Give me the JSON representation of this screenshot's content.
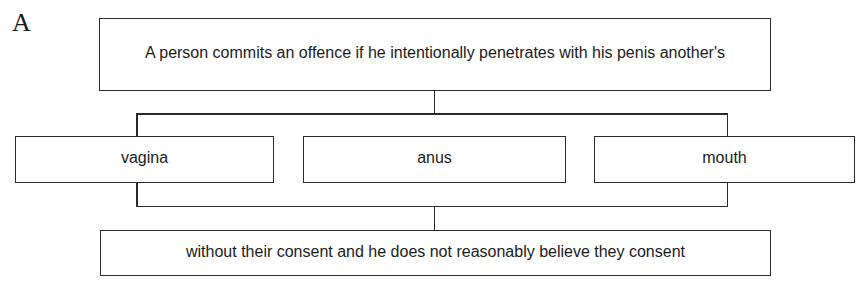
{
  "panel_label": "A",
  "diagram": {
    "top_box": {
      "text": "A person commits an offence if he intentionally penetrates with his penis another's"
    },
    "options": [
      {
        "label": "vagina"
      },
      {
        "label": "anus"
      },
      {
        "label": "mouth"
      }
    ],
    "bottom_box": {
      "text": "without their consent and he does not reasonably believe they consent"
    },
    "colors": {
      "line": "#2a2a2a",
      "text": "#1a1a1a",
      "background": "#ffffff"
    }
  }
}
